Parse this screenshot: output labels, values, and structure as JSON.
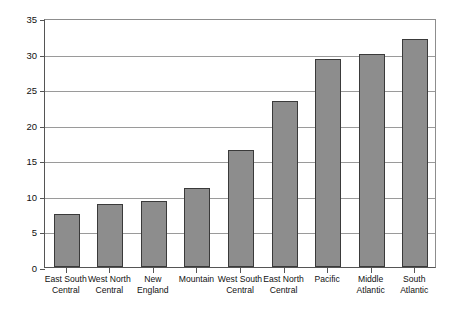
{
  "chart_data": {
    "type": "bar",
    "title": "",
    "subtitle": "",
    "xlabel": "",
    "ylabel": "",
    "ylim": [
      0,
      35
    ],
    "ytick_step": 5,
    "yticks": [
      "0",
      "5",
      "10",
      "15",
      "20",
      "25",
      "30",
      "35"
    ],
    "grid": true,
    "legend": false,
    "legend_position": "none",
    "categories": [
      "East South Central",
      "West North Central",
      "New England",
      "Mountain",
      "West South Central",
      "East North Central",
      "Pacific",
      "Middle Atlantic",
      "South Atlantic"
    ],
    "category_lines": [
      [
        "East South",
        "Central"
      ],
      [
        "West North",
        "Central"
      ],
      [
        "New",
        "England"
      ],
      [
        "Mountain"
      ],
      [
        "West South",
        "Central"
      ],
      [
        "East North",
        "Central"
      ],
      [
        "Pacific"
      ],
      [
        "Middle",
        "Atlantic"
      ],
      [
        "South",
        "Atlantic"
      ]
    ],
    "values": [
      7.5,
      8.8,
      9.3,
      11.1,
      16.4,
      23.4,
      29.2,
      30.0,
      32.1
    ],
    "series": [
      {
        "name": "",
        "values": [
          7.5,
          8.8,
          9.3,
          11.1,
          16.4,
          23.4,
          29.2,
          30.0,
          32.1
        ]
      }
    ],
    "colors": {
      "bar_fill": "#8d8d8d",
      "bar_border": "#3a3a3a",
      "gridline": "#9a9a9a",
      "axis": "#555555",
      "background": "#ffffff",
      "text": "#111111"
    }
  }
}
